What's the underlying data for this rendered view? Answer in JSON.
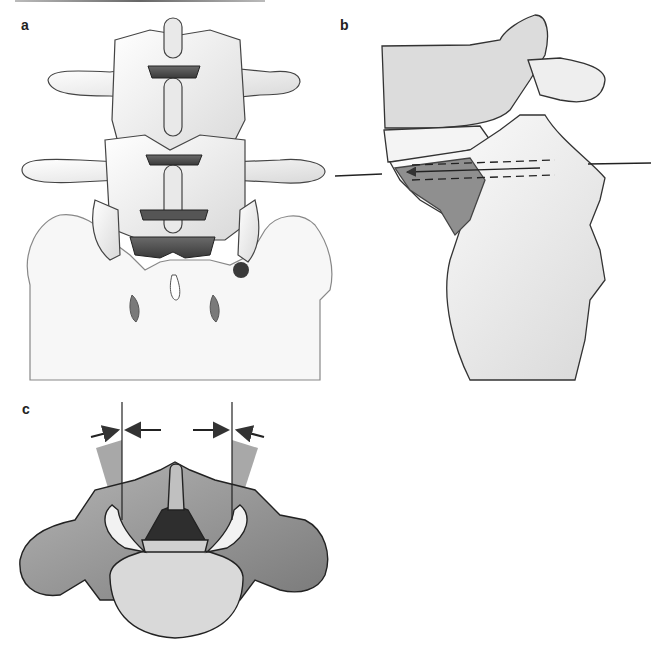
{
  "figure": {
    "panels": [
      {
        "label": "a",
        "description": "Posterior view of lower lumbar spine and sacrum with marked entry point"
      },
      {
        "label": "b",
        "description": "Lateral view of lumbosacral junction with screw trajectory (dashed lines and arrow)"
      },
      {
        "label": "c",
        "description": "Axial view of vertebra with angular convergence sectors and arrows"
      }
    ]
  },
  "colors": {
    "bone_light": "#f2f2f2",
    "bone_mid": "#c8c8c8",
    "bone_dark": "#4a4a4a",
    "marker": "#3a3a3a",
    "sector": "#9a9a9a",
    "line": "#333333"
  }
}
